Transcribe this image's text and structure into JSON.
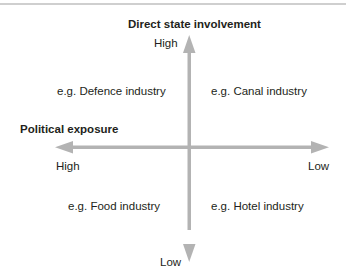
{
  "diagram": {
    "vertical_axis": {
      "title": "Direct state involvement",
      "high_label": "High",
      "low_label": "Low"
    },
    "horizontal_axis": {
      "title": "Political exposure",
      "high_label": "High",
      "low_label": "Low"
    },
    "quadrants": {
      "top_left": "e.g. Defence industry",
      "top_right": "e.g. Canal industry",
      "bottom_left": "e.g. Food industry",
      "bottom_right": "e.g. Hotel industry"
    },
    "colors": {
      "arrow": "#b3b3b3",
      "text": "#231f20",
      "top_rule": "#cfcfcf"
    }
  }
}
